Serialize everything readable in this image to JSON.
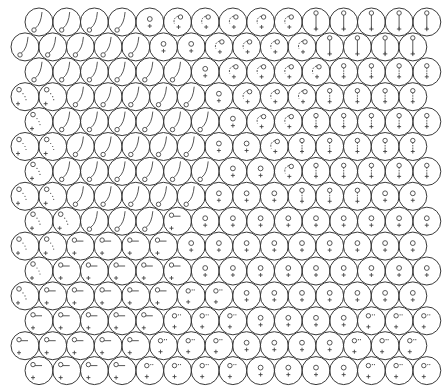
{
  "figure": {
    "rows": 15,
    "cols": 15,
    "circle_diameter": 28,
    "col_pitch": 27.7,
    "row_pitch": 24.9,
    "first_row_y": 22,
    "indented_x0": 39,
    "flush_x0": 25,
    "stroke_color": "#3a3a3a",
    "glyph_color": "#444444",
    "background": "#ffffff",
    "legend": {
      "T": "ring-bottom-tail-up",
      "H": "ring-hook-cross",
      "S": "ring-stick-cross",
      "P": "ring-short-stick-cross",
      "V": "ring-cross",
      "D": "ring-dots-cross",
      "L": "ring-dash-cross",
      "O": "ring-sparse-dots-cross"
    },
    "grid": [
      "TTTTVHHHHHSSSSS",
      "TTTTTVVHHHHSSSS",
      "TTTTTTVHHHHPPPP",
      "DDTTTTTVHHHPPPP",
      "DTTTTTTVHHPPPPP",
      "DDTTTTTVVHPPPPP",
      "DTTTTTTVVHPPPPP",
      "DDTTTTTVVVPPPVV",
      "DDTTTLVVVVVVVVV",
      "DDLLLLVVVVVVVVV",
      "DLLLLLVVVVVVVVV",
      "DLLLLLOOVVVVVVV",
      "LLLLLOOOVVVVOOO",
      "LLLLLOOOVVVVOOO",
      "LLLLOOOOVVVVOOO"
    ]
  }
}
